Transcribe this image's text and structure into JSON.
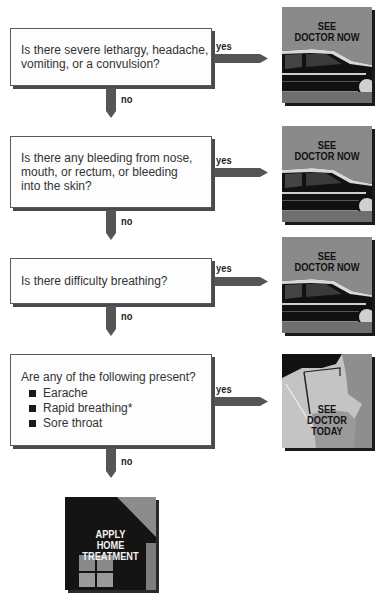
{
  "flowchart": {
    "questions": [
      {
        "text_lines": [
          "Is there severe lethargy, headache,",
          "vomiting, or a convulsion?"
        ],
        "yes_label": "yes",
        "no_label": "no",
        "outcome": "SEE DOCTOR NOW"
      },
      {
        "text_lines": [
          "Is there any bleeding from nose,",
          "mouth, or rectum, or bleeding",
          "into the skin?"
        ],
        "yes_label": "yes",
        "no_label": "no",
        "outcome": "SEE DOCTOR NOW"
      },
      {
        "text_lines": [
          "Is there difficulty breathing?"
        ],
        "yes_label": "yes",
        "no_label": "no",
        "outcome": "SEE DOCTOR NOW"
      },
      {
        "text_lines": [
          "Are any of the following present?"
        ],
        "bullets": [
          "Earache",
          "Rapid breathing*",
          "Sore throat"
        ],
        "yes_label": "yes",
        "no_label": "no",
        "outcome": "SEE DOCTOR TODAY"
      }
    ],
    "outcomes": {
      "doctor_now": {
        "line1": "SEE",
        "line2": "DOCTOR NOW",
        "icon": "car-icon"
      },
      "doctor_today": {
        "line1": "SEE",
        "line2": "DOCTOR",
        "line3": "TODAY",
        "icon": "doctor-face-icon"
      },
      "home_treatment": {
        "line1": "APPLY",
        "line2": "HOME",
        "line3": "TREATMENT",
        "icon": "house-icon"
      }
    },
    "colors": {
      "arrow": "#555555",
      "box_border": "#5a5a5a",
      "pic_background": "#8a8a8a",
      "car_body": "#111111",
      "home_dark": "#141414",
      "home_roof": "#8c8c8c"
    }
  }
}
